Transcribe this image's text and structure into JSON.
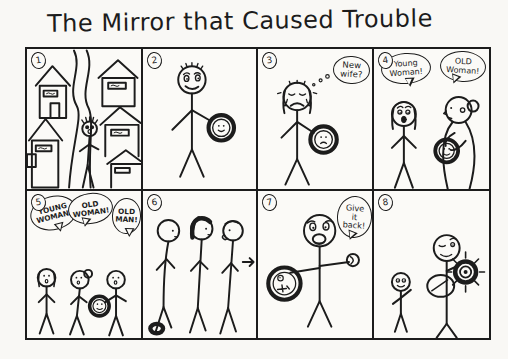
{
  "title": "The Mirror that Caused Trouble",
  "colors": {
    "ink": "#1c1c1c",
    "paper": "#f9f8f5"
  },
  "panels": [
    {
      "number": "1"
    },
    {
      "number": "2"
    },
    {
      "number": "3",
      "thought": "New wife?"
    },
    {
      "number": "4",
      "bubble_left": "Young Woman!",
      "bubble_right": "OLD Woman!"
    },
    {
      "number": "5",
      "bubble_1": "YOUNG WOMAN!",
      "bubble_2": "OLD WOMAN!",
      "bubble_3": "OLD MAN!"
    },
    {
      "number": "6"
    },
    {
      "number": "7",
      "bubble": "Give it back!"
    },
    {
      "number": "8"
    }
  ]
}
